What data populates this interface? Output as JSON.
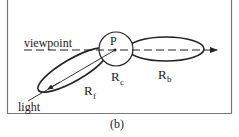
{
  "figure": {
    "caption": "(b)",
    "labels": {
      "viewpoint": "viewpoint",
      "light": "light",
      "point": "P",
      "r_c_main": "R",
      "r_c_sub": "c",
      "r_f_main": "R",
      "r_f_sub": "f",
      "r_b_main": "R",
      "r_b_sub": "b"
    },
    "colors": {
      "stroke": "#222222",
      "frame": "#888888",
      "background": "#ffffff"
    }
  }
}
